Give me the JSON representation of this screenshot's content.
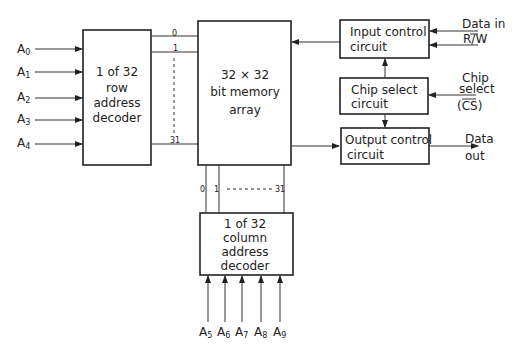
{
  "diagram": {
    "row_decoder": {
      "lines": [
        "1 of 32",
        "row",
        "address",
        "decoder"
      ]
    },
    "memory_array": {
      "lines": [
        "32 × 32",
        "bit memory",
        "array"
      ]
    },
    "input_control": {
      "lines": [
        "Input control",
        "circuit"
      ]
    },
    "chip_select": {
      "lines": [
        "Chip select",
        "circuit"
      ]
    },
    "output_control": {
      "lines": [
        "Output control",
        "circuit"
      ]
    },
    "column_decoder": {
      "lines": [
        "1 of 32",
        "column",
        "address",
        "decoder"
      ]
    },
    "row_inputs": [
      {
        "base": "A",
        "sub": "0"
      },
      {
        "base": "A",
        "sub": "1"
      },
      {
        "base": "A",
        "sub": "2"
      },
      {
        "base": "A",
        "sub": "3"
      },
      {
        "base": "A",
        "sub": "4"
      }
    ],
    "column_inputs": [
      {
        "base": "A",
        "sub": "5"
      },
      {
        "base": "A",
        "sub": "6"
      },
      {
        "base": "A",
        "sub": "7"
      },
      {
        "base": "A",
        "sub": "8"
      },
      {
        "base": "A",
        "sub": "9"
      }
    ],
    "row_line_labels": {
      "first": "0",
      "second": "1",
      "last": "31"
    },
    "column_line_labels": {
      "first": "0",
      "second": "1",
      "last": "31"
    },
    "signals": {
      "data_in": "Data in",
      "rw": "R/W",
      "chip_select": [
        "Chip",
        "select",
        "(CS)"
      ],
      "data_out": [
        "Data",
        "out"
      ]
    }
  }
}
